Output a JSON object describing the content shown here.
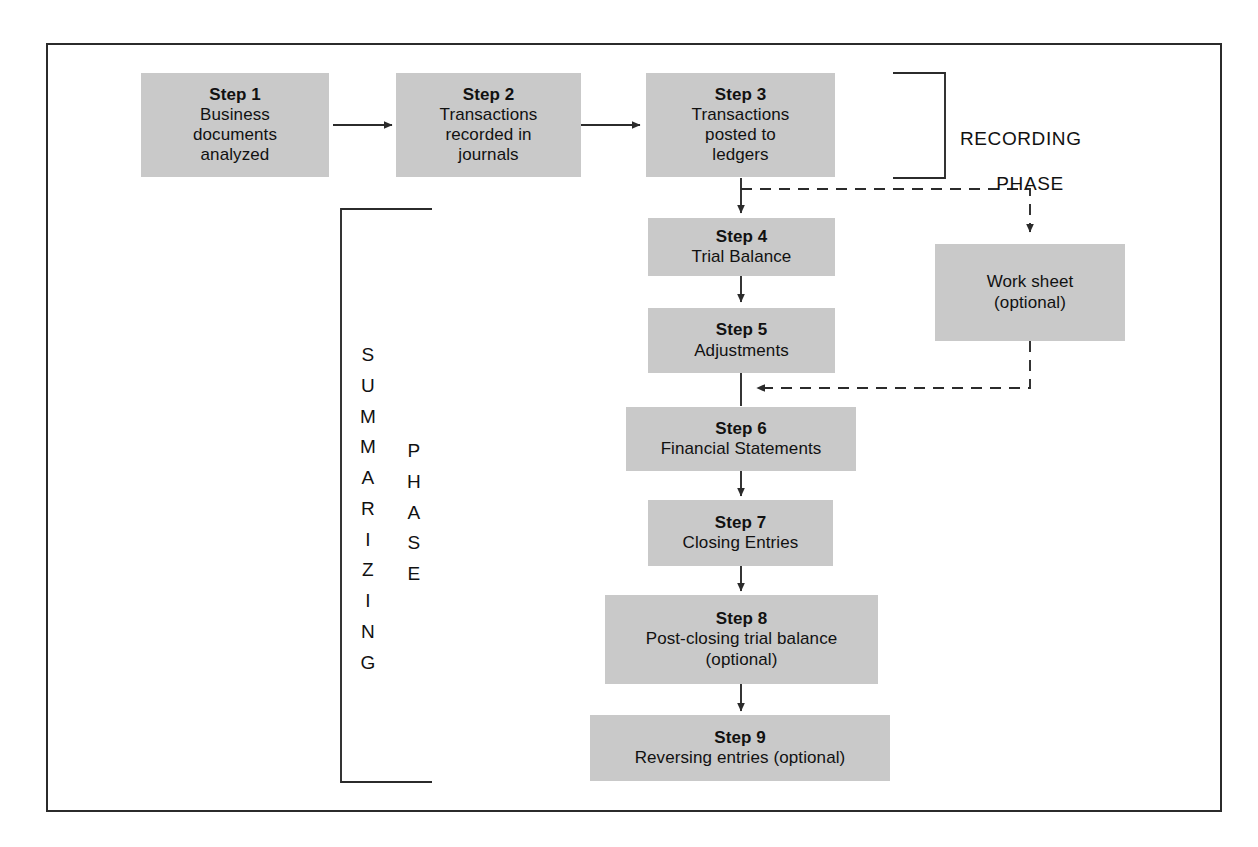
{
  "diagram": {
    "box_fill": "#c9c9c9",
    "line_color": "#2b2b2b",
    "boxes": [
      {
        "id": "step1",
        "title": "Step 1",
        "lines": [
          "Business",
          "documents",
          "analyzed"
        ]
      },
      {
        "id": "step2",
        "title": "Step 2",
        "lines": [
          "Transactions",
          "recorded in",
          "journals"
        ]
      },
      {
        "id": "step3",
        "title": "Step 3",
        "lines": [
          "Transactions",
          "posted to",
          "ledgers"
        ]
      },
      {
        "id": "step4",
        "title": "Step 4",
        "lines": [
          "Trial Balance"
        ]
      },
      {
        "id": "step5",
        "title": "Step 5",
        "lines": [
          "Adjustments"
        ]
      },
      {
        "id": "step6",
        "title": "Step 6",
        "lines": [
          "Financial Statements"
        ]
      },
      {
        "id": "step7",
        "title": "Step 7",
        "lines": [
          "Closing Entries"
        ]
      },
      {
        "id": "step8",
        "title": "Step 8",
        "lines": [
          "Post-closing trial balance",
          "(optional)"
        ]
      },
      {
        "id": "step9",
        "title": "Step 9",
        "lines": [
          "Reversing entries (optional)"
        ]
      },
      {
        "id": "worksheet",
        "title": "",
        "lines": [
          "Work sheet",
          "(optional)"
        ]
      }
    ],
    "phases": {
      "recording": {
        "line1": "RECORDING",
        "line2": "PHASE"
      },
      "summarizing": {
        "word1": "SUMMARIZING",
        "word2": "PHASE",
        "word1_letters": [
          "S",
          "U",
          "M",
          "M",
          "A",
          "R",
          "I",
          "Z",
          "I",
          "N",
          "G"
        ],
        "word2_letters": [
          "P",
          "H",
          "A",
          "S",
          "E"
        ]
      }
    }
  }
}
